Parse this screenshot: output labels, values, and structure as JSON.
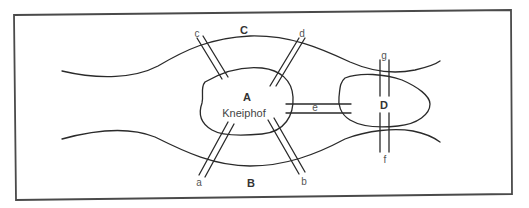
{
  "diagram": {
    "landmasses": {
      "A": {
        "label": "A",
        "name": "Kneiphof"
      },
      "B": {
        "label": "B"
      },
      "C": {
        "label": "C"
      },
      "D": {
        "label": "D"
      }
    },
    "bridges": [
      {
        "id": "a",
        "label": "a",
        "connects": [
          "A",
          "B"
        ]
      },
      {
        "id": "b",
        "label": "b",
        "connects": [
          "A",
          "B"
        ]
      },
      {
        "id": "c",
        "label": "c",
        "connects": [
          "A",
          "C"
        ]
      },
      {
        "id": "d",
        "label": "d",
        "connects": [
          "A",
          "C"
        ]
      },
      {
        "id": "e",
        "label": "e",
        "connects": [
          "A",
          "D"
        ]
      },
      {
        "id": "f",
        "label": "f",
        "connects": [
          "D",
          "B"
        ]
      },
      {
        "id": "g",
        "label": "g",
        "connects": [
          "D",
          "C"
        ]
      }
    ],
    "colors": {
      "stroke": "#2a2a2a",
      "frame": "#4a4a4a",
      "background": "#ffffff"
    }
  }
}
